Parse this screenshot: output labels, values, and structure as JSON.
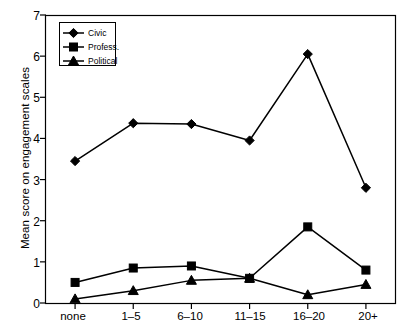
{
  "chart_data": {
    "type": "line",
    "title": "",
    "xlabel": "",
    "ylabel": "Mean score on engagement scales",
    "categories": [
      "none",
      "1–5",
      "6–10",
      "11–15",
      "16–20",
      "20+"
    ],
    "ylim": [
      0,
      7
    ],
    "yticks": [
      0,
      1,
      2,
      3,
      4,
      5,
      6,
      7
    ],
    "ytick_labels": [
      "0",
      "1",
      "2",
      "3",
      "4",
      "5",
      "6",
      "7"
    ],
    "grid": false,
    "legend_position": "top-left",
    "series": [
      {
        "name": "Civic",
        "marker": "diamond",
        "color": "#000000",
        "values": [
          3.45,
          4.37,
          4.35,
          3.95,
          6.05,
          2.8
        ]
      },
      {
        "name": "Profess.",
        "marker": "square",
        "color": "#000000",
        "values": [
          0.5,
          0.85,
          0.9,
          0.6,
          1.85,
          0.8
        ]
      },
      {
        "name": "Political",
        "marker": "triangle",
        "color": "#000000",
        "values": [
          0.1,
          0.3,
          0.55,
          0.6,
          0.2,
          0.45
        ]
      }
    ]
  },
  "axis": {
    "y_label_text": "Mean score on engagement scales",
    "y_tick_0": "0",
    "y_tick_1": "1",
    "y_tick_2": "2",
    "y_tick_3": "3",
    "y_tick_4": "4",
    "y_tick_5": "5",
    "y_tick_6": "6",
    "y_tick_7": "7",
    "x_tick_0": "none",
    "x_tick_1": "1–5",
    "x_tick_2": "6–10",
    "x_tick_3": "11–15",
    "x_tick_4": "16–20",
    "x_tick_5": "20+"
  },
  "legend": {
    "items": [
      {
        "label": "Civic",
        "marker": "diamond-marker-icon"
      },
      {
        "label": "Profess.",
        "marker": "square-marker-icon"
      },
      {
        "label": "Political",
        "marker": "triangle-marker-icon"
      }
    ]
  }
}
